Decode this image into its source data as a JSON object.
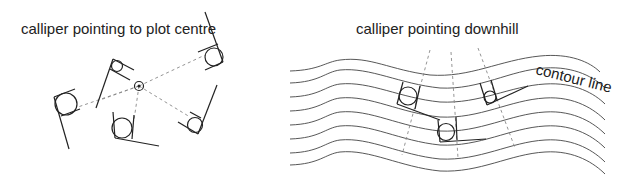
{
  "diagram": {
    "left_panel": {
      "title": "calliper pointing to plot centre",
      "plot_centre_marker": "plot-centre-icon",
      "callipers": [
        {
          "name": "calliper-left",
          "position": "left"
        },
        {
          "name": "calliper-upper",
          "position": "upper-left of centre"
        },
        {
          "name": "calliper-bottom",
          "position": "below centre"
        },
        {
          "name": "calliper-top-right",
          "position": "upper right"
        },
        {
          "name": "calliper-bottom-right",
          "position": "lower right"
        }
      ]
    },
    "right_panel": {
      "title": "calliper pointing downhill",
      "contour_label": "contour line",
      "contour_line_count": 8,
      "callipers": [
        {
          "name": "calliper-downhill-1",
          "position": "left"
        },
        {
          "name": "calliper-downhill-2",
          "position": "middle-low"
        },
        {
          "name": "calliper-downhill-3",
          "position": "right"
        }
      ]
    },
    "colors": {
      "line": "#222222",
      "dashed": "#888888",
      "background": "#ffffff"
    }
  }
}
